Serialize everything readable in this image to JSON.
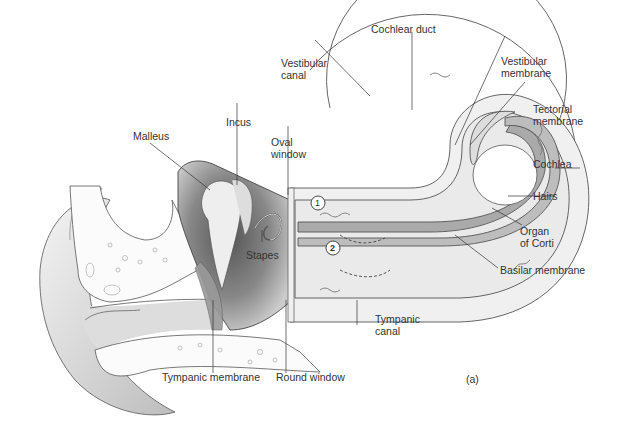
{
  "figure": {
    "panel_label": "(a)",
    "labels": {
      "cochlear_duct": "Cochlear duct",
      "vestibular_canal": "Vestibular\ncanal",
      "vestibular_membrane": "Vestibular\nmembrane",
      "tectorial_membrane": "Tectorial\nmembrane",
      "cochlea": "Cochlea",
      "hairs": "Hairs",
      "organ_of_corti": "Organ\nof Corti",
      "basilar_membrane": "Basilar membrane",
      "tympanic_canal": "Tympanic\ncanal",
      "malleus": "Malleus",
      "incus": "Incus",
      "oval_window": "Oval\nwindow",
      "stapes": "Stapes",
      "tympanic_membrane": "Tympanic membrane",
      "round_window": "Round window"
    },
    "markers": {
      "one": "1",
      "two": "2"
    }
  }
}
